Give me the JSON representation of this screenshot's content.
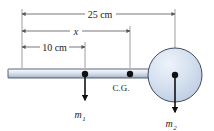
{
  "figure": {
    "background_color": "#ffffff"
  },
  "dimensions": [
    {
      "id": "total-length",
      "label": "25 cm",
      "value": 25,
      "unit": "cm",
      "from_x": 22,
      "to_x": 175,
      "y": 14,
      "label_x": 100,
      "label_y": 17
    },
    {
      "id": "distance-to-cg",
      "label": "x",
      "value": null,
      "unit": "cm",
      "from_x": 22,
      "to_x": 130,
      "y": 31,
      "label_x": 76,
      "label_y": 34
    },
    {
      "id": "distance-to-m1",
      "label": "10 cm",
      "value": 10,
      "unit": "cm",
      "from_x": 22,
      "to_x": 85,
      "y": 47,
      "label_x": 54,
      "label_y": 50
    }
  ],
  "bar": {
    "label": "rod",
    "x": 8,
    "y": 69,
    "width": 144,
    "height": 9,
    "fill_top": "#e9eef6",
    "fill_bottom": "#aab6cc",
    "stroke": "#4a5568"
  },
  "disk": {
    "label": "m2-disk",
    "cx": 175,
    "cy": 75,
    "r": 27,
    "fill": "#ccd9ec",
    "stroke": "#3f4b5e"
  },
  "points": [
    {
      "id": "m1-point",
      "label": "m",
      "subscript": "1",
      "cx": 85,
      "cy": 74,
      "r": 3.2
    },
    {
      "id": "cg-point",
      "label": "C.G.",
      "subscript": "",
      "cx": 130,
      "cy": 74,
      "r": 3.2
    },
    {
      "id": "m2-point",
      "label": "m",
      "subscript": "2",
      "cx": 175,
      "cy": 75,
      "r": 3.2
    }
  ],
  "force_arrows": [
    {
      "id": "m1-weight-arrow",
      "x": 85,
      "from_y": 74,
      "to_y": 100
    },
    {
      "id": "m2-weight-arrow",
      "x": 175,
      "from_y": 75,
      "to_y": 112
    }
  ],
  "labels": {
    "cg": "C.G.",
    "cg_x": 121,
    "cg_y": 90,
    "m1": "m",
    "m1_sub": "1",
    "m1_x": 80,
    "m1_y": 117,
    "m2": "m",
    "m2_sub": "2",
    "m2_x": 170,
    "m2_y": 126
  },
  "colors": {
    "line": "#555555",
    "text": "#1a1a1a",
    "bar_stroke": "#4a5568",
    "disk_fill": "#ccd9ec",
    "disk_stroke": "#3f4b5e",
    "arrow": "#111111"
  }
}
